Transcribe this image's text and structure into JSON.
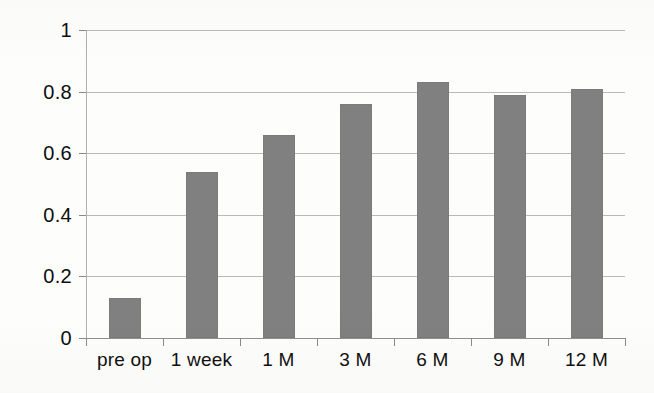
{
  "chart_data": {
    "type": "bar",
    "title": "",
    "subtitle": "",
    "xlabel": "",
    "ylabel": "",
    "categories": [
      "pre op",
      "1 week",
      "1 M",
      "3 M",
      "6 M",
      "9 M",
      "12 M"
    ],
    "values": [
      0.13,
      0.54,
      0.66,
      0.76,
      0.83,
      0.79,
      0.81
    ],
    "ylim": [
      0,
      1
    ],
    "ytick_labels": [
      "1",
      "0.8",
      "0.6",
      "0.4",
      "0.2",
      "0"
    ],
    "ytick_values": [
      1,
      0.8,
      0.6,
      0.4,
      0.2,
      0
    ],
    "grid": true,
    "legend": false,
    "legend_position": "none",
    "series": [
      {
        "name": "",
        "values": [
          0.13,
          0.54,
          0.66,
          0.76,
          0.83,
          0.79,
          0.81
        ]
      }
    ],
    "colors": {
      "bar_fill": "#808080",
      "bar_stroke": "#7b7b7b",
      "gridline": "#b9b9b9",
      "axis": "#8f8f8f",
      "text": "#101010",
      "background": "#fdfdfc"
    }
  }
}
